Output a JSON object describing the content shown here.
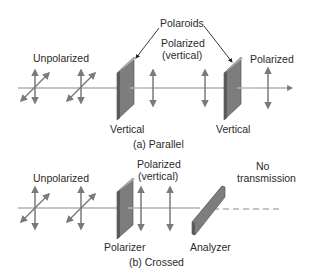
{
  "figure": {
    "panel_a": {
      "caption": "(a) Parallel",
      "labels": {
        "unpolarized": "Unpolarized",
        "polaroids": "Polaroids",
        "polarized_vertical_line1": "Polarized",
        "polarized_vertical_line2": "(vertical)",
        "polarized": "Polarized",
        "polaroid1": "Vertical",
        "polaroid2": "Vertical"
      }
    },
    "panel_b": {
      "caption": "(b) Crossed",
      "labels": {
        "unpolarized": "Unpolarized",
        "polarized_vertical_line1": "Polarized",
        "polarized_vertical_line2": "(vertical)",
        "no_transmission_line1": "No",
        "no_transmission_line2": "transmission",
        "polarizer": "Polarizer",
        "analyzer": "Analyzer"
      }
    },
    "colors": {
      "beam": "#8a8a8a",
      "arrow": "#7a7a7a",
      "plate_face": "#7d7d7d",
      "plate_edge": "#5a5a5a",
      "plate_top": "#b0b0b0",
      "text": "#2a2a2a"
    }
  }
}
